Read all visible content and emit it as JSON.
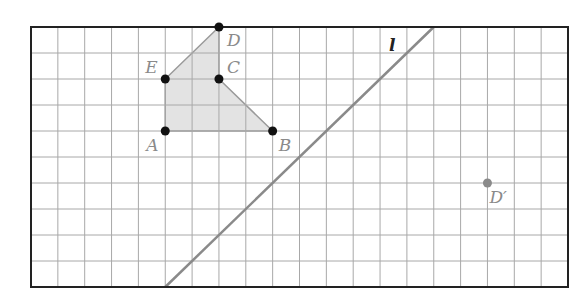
{
  "figure": {
    "grid": {
      "cols": 20,
      "rows": 10,
      "left": 31,
      "top": 27,
      "right": 568,
      "bottom": 287
    },
    "colors": {
      "grid_line": "#a8a8a8",
      "border": "#222222",
      "shape_fill": "#dedede",
      "shape_edge": "#9a9a9a",
      "point": "#111111",
      "image_point": "#8a8a8a",
      "line_l": "#8a8a8a",
      "label": "#8a8a8a",
      "line_label": "#222222"
    },
    "shape": {
      "name": "pentagon ABCDE",
      "vertices": [
        "A",
        "B",
        "C",
        "D",
        "E"
      ]
    },
    "points": [
      {
        "id": "A",
        "label": "A",
        "col": 5,
        "row": 4,
        "label_dx": -19,
        "label_dy": 20
      },
      {
        "id": "B",
        "label": "B",
        "col": 9,
        "row": 4,
        "label_dx": 6,
        "label_dy": 20
      },
      {
        "id": "C",
        "label": "C",
        "col": 7,
        "row": 2,
        "label_dx": 8,
        "label_dy": -6
      },
      {
        "id": "D",
        "label": "D",
        "col": 7,
        "row": 0,
        "label_dx": 8,
        "label_dy": 19
      },
      {
        "id": "E",
        "label": "E",
        "col": 5,
        "row": 2,
        "label_dx": -20,
        "label_dy": -6
      }
    ],
    "image_point": {
      "id": "D'",
      "label": "D′",
      "col": 17,
      "row": 6,
      "label_dx": 2,
      "label_dy": 20
    },
    "line_l": {
      "label": "l",
      "from": {
        "col": 5,
        "row": 10
      },
      "to": {
        "col": 15,
        "row": 0
      },
      "label_x": 389,
      "label_y": 51
    }
  }
}
